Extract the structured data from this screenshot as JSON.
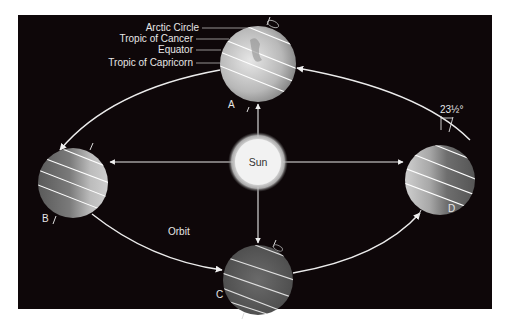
{
  "diagram": {
    "sun_label": "Sun",
    "orbit_label": "Orbit",
    "tilt_label": "23½°",
    "latitude_labels": [
      "Arctic Circle",
      "Tropic of Cancer",
      "Equator",
      "Tropic of Capricorn"
    ],
    "positions": [
      {
        "id": "A",
        "label": "A"
      },
      {
        "id": "B",
        "label": "B"
      },
      {
        "id": "C",
        "label": "C"
      },
      {
        "id": "D",
        "label": "D"
      }
    ],
    "colors": {
      "background": "#0e0709",
      "page": "#ffffff",
      "lines": "#e8e8e8",
      "sun": "#f2f2f2"
    }
  }
}
